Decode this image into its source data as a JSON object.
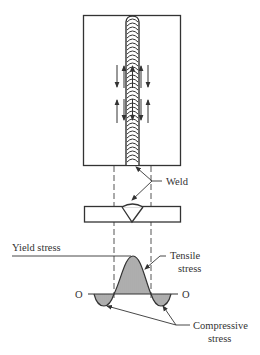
{
  "figure": {
    "labels": {
      "weld": "Weld",
      "yield_stress": "Yield stress",
      "tensile_line1": "Tensile",
      "tensile_line2": "stress",
      "compressive_line1": "Compressive",
      "compressive_line2": "stress",
      "origin_left": "O",
      "origin_right": "O"
    },
    "colors": {
      "stroke": "#333333",
      "background": "#ffffff"
    }
  }
}
